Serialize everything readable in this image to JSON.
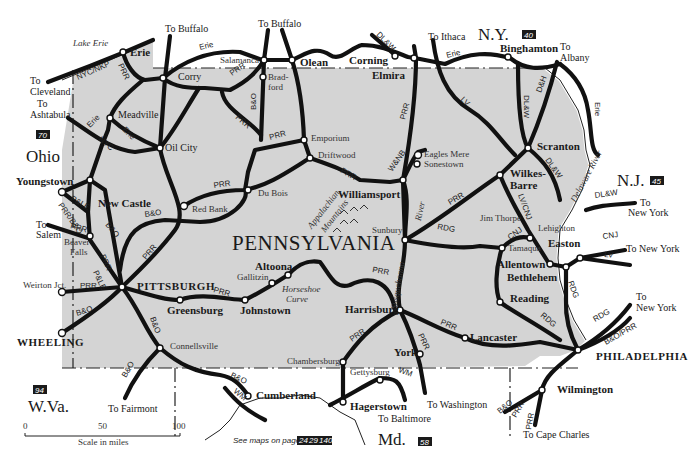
{
  "map": {
    "title": "PENNSYLVANIA",
    "colors": {
      "land": "#d4d4d4",
      "background": "#ffffff",
      "rail": "#111111"
    },
    "states": [
      {
        "name": "Ohio",
        "page": "70"
      },
      {
        "name": "N.Y.",
        "page": "40"
      },
      {
        "name": "N.J.",
        "page": "45"
      },
      {
        "name": "W.Va.",
        "page": "94"
      },
      {
        "name": "Md.",
        "page": "58"
      }
    ],
    "water": {
      "lake_erie": "Lake Erie",
      "delaware": "Delaware River",
      "susquehanna": "Susquehanna",
      "river": "River"
    },
    "terrain": {
      "mountains_1": "Appalachian",
      "mountains_2": "Mountains",
      "curve_1": "Horseshoe",
      "curve_2": "Curve"
    },
    "cities": {
      "erie": "Erie",
      "corry": "Corry",
      "meadville": "Meadville",
      "oil_city": "Oil City",
      "salamanca": "Salamanca",
      "olean": "Olean",
      "corning": "Corning",
      "elmira": "Elmira",
      "binghamton": "Binghamton",
      "bradford_1": "Brad-",
      "bradford_2": "ford",
      "emporium": "Emporium",
      "driftwood": "Driftwood",
      "du_bois": "Du Bois",
      "red_bank": "Red Bank",
      "williamsport": "Williamsport",
      "eagles_mere": "Eagles Mere",
      "sonestown": "Sonestown",
      "scranton": "Scranton",
      "wilkes_1": "Wilkes-",
      "wilkes_2": "Barre",
      "sunbury": "Sunbury",
      "jim_thorpe": "Jim Thorpe",
      "lehighton": "Lehighton",
      "tamaqua": "Tamaqua",
      "easton": "Easton",
      "allentown": "Allentown",
      "bethlehem": "Bethlehem",
      "reading": "Reading",
      "lancaster": "Lancaster",
      "harrisburg": "Harrisburg",
      "york": "York",
      "gettysburg": "Gettysburg",
      "chambersburg": "Chambersburg",
      "hagerstown": "Hagerstown",
      "cumberland": "Cumberland",
      "connellsville": "Connellsville",
      "johnstown": "Johnstown",
      "altoona": "Altoona",
      "gallitzin": "Gallitzin",
      "greensburg": "Greensburg",
      "pittsburgh": "PITTSBURGH",
      "youngstown": "Youngstown",
      "new_castle": "New Castle",
      "beaver_1": "Beaver",
      "beaver_2": "Falls",
      "weirton": "Weirton Jct.",
      "wheeling": "WHEELING",
      "philadelphia": "PHILADELPHIA",
      "wilmington": "Wilmington"
    },
    "destinations": {
      "buffalo_1": "To Buffalo",
      "buffalo_2": "To Buffalo",
      "ithaca": "To Ithaca",
      "albany_1": "To",
      "albany_2": "Albany",
      "cleveland_1": "To",
      "cleveland_2": "Cleveland",
      "ashtabula_1": "To",
      "ashtabula_2": "Ashtabula",
      "salem_1": "To",
      "salem_2": "Salem",
      "fairmont": "To Fairmont",
      "baltimore": "To Baltimore",
      "washington": "To Washington",
      "cape_charles": "To Cape Charles",
      "ny_1_a": "To",
      "ny_1_b": "New York",
      "ny_2": "To New York",
      "ny_3_a": "To",
      "ny_3_b": "New York"
    },
    "railroads": {
      "nyc_nkp": "NYC/NKP",
      "prr": "PRR",
      "erie": "Erie",
      "nyc": "NYC",
      "bo": "B&O",
      "dlw": "DL&W",
      "lv": "LV",
      "dh": "D&H",
      "wnb": "W&NB",
      "rdg": "RDG",
      "cnj": "CNJ",
      "lv_cnj": "LV/CNJ",
      "ple": "P&LE",
      "prr_bo": "PRR/B&O",
      "wm": "WM",
      "bo_prr": "B&O/PRR"
    },
    "scale": {
      "label": "Scale in miles",
      "ticks": [
        "0",
        "50",
        "100"
      ]
    },
    "see_maps": {
      "label": "See maps on pages",
      "pages": [
        "24",
        "29",
        "140"
      ]
    }
  }
}
